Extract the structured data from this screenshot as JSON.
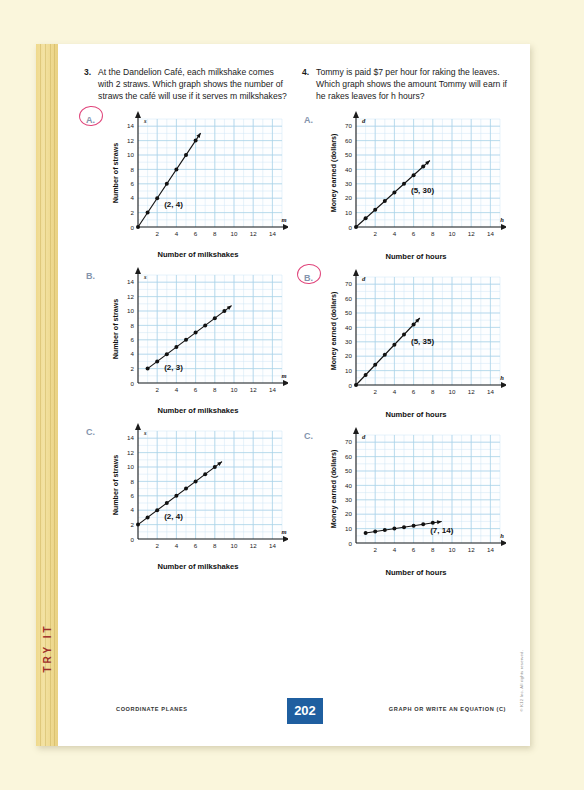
{
  "page": {
    "tab_label": "TRY IT",
    "copyright": "© K12 Inc. All rights reserved."
  },
  "footer": {
    "left": "COORDINATE PLANES",
    "page_number": "202",
    "right": "GRAPH OR WRITE AN EQUATION (C)"
  },
  "questions": [
    {
      "number": "3.",
      "text": "At the Dandelion Café, each milkshake comes with 2 straws. Which graph shows the number of straws the café will use if it serves m milkshakes?",
      "choices": [
        {
          "label": "A.",
          "selected": true,
          "point_label": "(2, 4)"
        },
        {
          "label": "B.",
          "selected": false,
          "point_label": "(2, 3)"
        },
        {
          "label": "C.",
          "selected": false,
          "point_label": "(2, 4)"
        }
      ]
    },
    {
      "number": "4.",
      "text": "Tommy is paid $7 per hour for raking the leaves. Which graph shows the amount Tommy will earn if he rakes leaves for h hours?",
      "choices": [
        {
          "label": "A.",
          "selected": false,
          "point_label": "(5, 30)"
        },
        {
          "label": "B.",
          "selected": true,
          "point_label": "(5, 35)"
        },
        {
          "label": "C.",
          "selected": false,
          "point_label": "(7, 14)"
        }
      ]
    }
  ],
  "chart_data": [
    {
      "id": "q3a",
      "type": "scatter",
      "title": "",
      "xlabel": "Number of milkshakes",
      "ylabel": "Number of straws",
      "x_axis_variable": "m",
      "y_axis_variable": "s",
      "xlim": [
        0,
        15
      ],
      "ylim": [
        0,
        15
      ],
      "xticks": [
        2,
        4,
        6,
        8,
        10,
        12,
        14
      ],
      "yticks": [
        2,
        4,
        6,
        8,
        10,
        12,
        14
      ],
      "origin_label": "0",
      "grid": true,
      "annotation": "(2, 4)",
      "x": [
        0,
        1,
        2,
        3,
        4,
        5,
        6
      ],
      "y": [
        0,
        2,
        4,
        6,
        8,
        10,
        12
      ],
      "line": true
    },
    {
      "id": "q3b",
      "type": "scatter",
      "title": "",
      "xlabel": "Number of milkshakes",
      "ylabel": "Number of straws",
      "x_axis_variable": "m",
      "y_axis_variable": "s",
      "xlim": [
        0,
        15
      ],
      "ylim": [
        0,
        15
      ],
      "xticks": [
        2,
        4,
        6,
        8,
        10,
        12,
        14
      ],
      "yticks": [
        2,
        4,
        6,
        8,
        10,
        12,
        14
      ],
      "origin_label": "0",
      "grid": true,
      "annotation": "(2, 3)",
      "x": [
        1,
        2,
        3,
        4,
        5,
        6,
        7,
        8,
        9
      ],
      "y": [
        2,
        3,
        4,
        5,
        6,
        7,
        8,
        9,
        10
      ],
      "line": true
    },
    {
      "id": "q3c",
      "type": "scatter",
      "title": "",
      "xlabel": "Number of milkshakes",
      "ylabel": "Number of straws",
      "x_axis_variable": "m",
      "y_axis_variable": "s",
      "xlim": [
        0,
        15
      ],
      "ylim": [
        0,
        15
      ],
      "xticks": [
        2,
        4,
        6,
        8,
        10,
        12,
        14
      ],
      "yticks": [
        2,
        4,
        6,
        8,
        10,
        12,
        14
      ],
      "origin_label": "0",
      "grid": true,
      "annotation": "(2, 4)",
      "x": [
        0,
        1,
        2,
        3,
        4,
        5,
        6,
        7,
        8
      ],
      "y": [
        2,
        3,
        4,
        5,
        6,
        7,
        8,
        9,
        10
      ],
      "line": true
    },
    {
      "id": "q4a",
      "type": "scatter",
      "title": "",
      "xlabel": "Number of hours",
      "ylabel": "Money earned (dollars)",
      "x_axis_variable": "h",
      "y_axis_variable": "d",
      "xlim": [
        0,
        15
      ],
      "ylim": [
        0,
        75
      ],
      "xticks": [
        2,
        4,
        6,
        8,
        10,
        12,
        14
      ],
      "yticks": [
        10,
        20,
        30,
        40,
        50,
        60,
        70
      ],
      "origin_label": "0",
      "grid": true,
      "annotation": "(5, 30)",
      "x": [
        0,
        1,
        2,
        3,
        4,
        5,
        6,
        7
      ],
      "y": [
        0,
        6,
        12,
        18,
        24,
        30,
        36,
        42
      ],
      "line": true
    },
    {
      "id": "q4b",
      "type": "scatter",
      "title": "",
      "xlabel": "Number of hours",
      "ylabel": "Money earned (dollars)",
      "x_axis_variable": "h",
      "y_axis_variable": "d",
      "xlim": [
        0,
        15
      ],
      "ylim": [
        0,
        75
      ],
      "xticks": [
        2,
        4,
        6,
        8,
        10,
        12,
        14
      ],
      "yticks": [
        10,
        20,
        30,
        40,
        50,
        60,
        70
      ],
      "origin_label": "0",
      "grid": true,
      "annotation": "(5, 35)",
      "x": [
        0,
        1,
        2,
        3,
        4,
        5,
        6
      ],
      "y": [
        0,
        7,
        14,
        21,
        28,
        35,
        42
      ],
      "line": true
    },
    {
      "id": "q4c",
      "type": "scatter",
      "title": "",
      "xlabel": "Number of hours",
      "ylabel": "Money earned (dollars)",
      "x_axis_variable": "h",
      "y_axis_variable": "d",
      "xlim": [
        0,
        15
      ],
      "ylim": [
        0,
        75
      ],
      "xticks": [
        2,
        4,
        6,
        8,
        10,
        12,
        14
      ],
      "yticks": [
        10,
        20,
        30,
        40,
        50,
        60,
        70
      ],
      "origin_label": "0",
      "grid": true,
      "annotation": "(7, 14)",
      "x": [
        1,
        2,
        3,
        4,
        5,
        6,
        7,
        8
      ],
      "y": [
        7,
        8,
        9,
        10,
        11,
        12,
        13,
        14
      ],
      "line": true
    }
  ]
}
